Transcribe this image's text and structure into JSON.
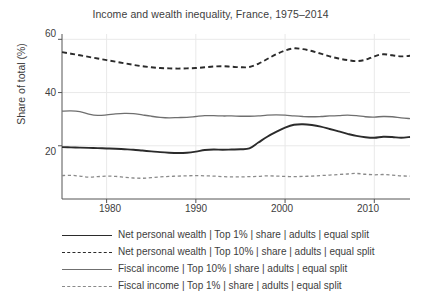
{
  "chart_data": {
    "type": "line",
    "title": "Income and wealth inequality, France, 1975–2014",
    "xlabel": "",
    "ylabel": "Share of total (%)",
    "xlim": [
      1975,
      2014
    ],
    "ylim": [
      0,
      62
    ],
    "yticks": [
      20,
      40,
      60
    ],
    "xticks": [
      1980,
      1990,
      2000,
      2010
    ],
    "grid": true,
    "legend_position": "below",
    "x": [
      1975,
      1976,
      1977,
      1978,
      1979,
      1980,
      1981,
      1982,
      1983,
      1984,
      1985,
      1986,
      1987,
      1988,
      1989,
      1990,
      1991,
      1992,
      1993,
      1994,
      1995,
      1996,
      1997,
      1998,
      1999,
      2000,
      2001,
      2002,
      2003,
      2004,
      2005,
      2006,
      2007,
      2008,
      2009,
      2010,
      2011,
      2012,
      2013,
      2014
    ],
    "series": [
      {
        "name": "Net personal wealth | Top 1% | share | adults | equal split",
        "style": "solid",
        "color": "#2b2b2b",
        "width": 1.9,
        "values": [
          19.5,
          19.4,
          19.3,
          19.2,
          19.1,
          19.0,
          18.9,
          18.7,
          18.5,
          18.2,
          17.9,
          17.6,
          17.4,
          17.3,
          17.4,
          17.8,
          18.4,
          18.6,
          18.5,
          18.6,
          18.7,
          19.0,
          21.2,
          23.4,
          25.2,
          26.8,
          27.9,
          28.1,
          27.8,
          27.2,
          26.3,
          25.4,
          24.5,
          23.7,
          23.2,
          23.0,
          23.4,
          23.3,
          23.0,
          23.3
        ]
      },
      {
        "name": "Net personal wealth | Top 10% | share | adults | equal split",
        "style": "dashed",
        "color": "#2b2b2b",
        "width": 1.9,
        "values": [
          55.2,
          54.6,
          54.0,
          53.4,
          52.8,
          52.2,
          51.6,
          51.0,
          50.4,
          49.9,
          49.5,
          49.2,
          49.1,
          49.0,
          49.1,
          49.2,
          49.5,
          49.8,
          49.9,
          49.7,
          49.5,
          49.6,
          50.8,
          52.6,
          54.4,
          55.8,
          56.6,
          56.3,
          55.6,
          54.6,
          53.6,
          52.8,
          52.2,
          51.8,
          52.3,
          53.6,
          54.4,
          54.0,
          53.6,
          53.8
        ]
      },
      {
        "name": "Fiscal income | Top 10% | share | adults | equal split",
        "style": "solid",
        "color": "#6f6f6f",
        "width": 1.3,
        "values": [
          33.0,
          33.1,
          32.8,
          31.9,
          31.4,
          31.6,
          32.0,
          32.2,
          32.1,
          31.6,
          31.1,
          30.7,
          30.5,
          30.6,
          30.7,
          31.0,
          31.3,
          31.3,
          31.2,
          31.2,
          31.1,
          31.1,
          31.2,
          31.5,
          31.6,
          31.5,
          31.2,
          31.0,
          30.9,
          31.0,
          31.2,
          31.3,
          31.5,
          31.3,
          30.9,
          30.8,
          31.0,
          30.9,
          30.5,
          30.2
        ]
      },
      {
        "name": "Fiscal income | Top 1% | share | adults | equal split",
        "style": "dashed",
        "color": "#8a8a8a",
        "width": 1.3,
        "values": [
          8.8,
          8.9,
          8.6,
          8.2,
          8.4,
          8.6,
          8.5,
          8.2,
          7.9,
          7.8,
          8.0,
          8.3,
          8.5,
          8.6,
          8.7,
          8.8,
          8.7,
          8.6,
          8.4,
          8.3,
          8.3,
          8.4,
          8.5,
          8.7,
          8.6,
          8.5,
          8.4,
          8.5,
          8.6,
          8.8,
          9.0,
          9.2,
          9.4,
          9.6,
          9.3,
          9.1,
          9.2,
          9.0,
          8.7,
          8.6
        ]
      }
    ]
  },
  "axis": {
    "ytick_labels": [
      "60",
      "40",
      "20"
    ],
    "xtick_labels": [
      "1980",
      "1990",
      "2000",
      "2010"
    ]
  },
  "legend": {
    "items": [
      {
        "label": "Net personal wealth | Top 1% | share | adults | equal split",
        "style": "solid-black"
      },
      {
        "label": "Net personal wealth | Top 10% | share | adults | equal split",
        "style": "dashed-black"
      },
      {
        "label": "Fiscal income | Top 10% | share | adults | equal split",
        "style": "solid-gray"
      },
      {
        "label": "Fiscal income | Top 1% | share | adults | equal split",
        "style": "dashed-gray"
      }
    ]
  },
  "colors": {
    "wealth_series": "#2b2b2b",
    "income_series": "#6f6f6f",
    "gridline": "#e9e9e9",
    "axis": "#555555",
    "text": "#3d3d3d",
    "background": "#ffffff"
  }
}
